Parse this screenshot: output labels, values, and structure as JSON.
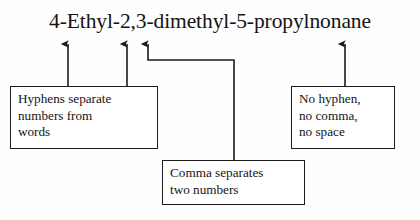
{
  "diagram": {
    "title": "4-Ethyl-2,3-dimethyl-5-propylnonane",
    "line_color": "#1c1c1c",
    "text_color": "#141414",
    "background_color": "#fefefe"
  },
  "callouts": {
    "hyphens": {
      "line1": "Hyphens separate",
      "line2": "numbers from",
      "line3": "words"
    },
    "comma": {
      "line1": "Comma separates",
      "line2": "two numbers"
    },
    "no_separator": {
      "line1": "No hyphen,",
      "line2": "no comma,",
      "line3": "no space"
    }
  },
  "annotations": [
    {
      "target": "hyphen after 4",
      "arrow_x": 68,
      "from_callout": "hyphens"
    },
    {
      "target": "hyphen after Ethyl",
      "arrow_x": 127,
      "from_callout": "hyphens"
    },
    {
      "target": "comma between 2 and 3",
      "arrow_x": 148,
      "from_callout": "comma"
    },
    {
      "target": "junction between propyl and nonane",
      "arrow_x": 345,
      "from_callout": "no_separator"
    }
  ]
}
